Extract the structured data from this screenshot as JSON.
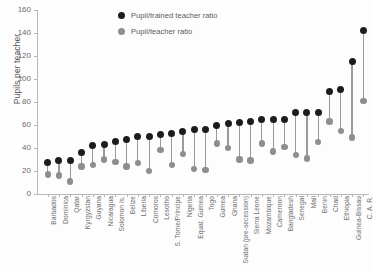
{
  "chart_data": {
    "type": "scatter",
    "title": "",
    "xlabel": "",
    "ylabel": "Pupils per teacher",
    "ylim": [
      0,
      160
    ],
    "yticks": [
      0,
      20,
      40,
      60,
      80,
      100,
      120,
      140,
      160
    ],
    "grid": false,
    "legend_position": "top-center",
    "categories": [
      "Barbados",
      "Dominica",
      "Qatar",
      "Kyrgyzstan",
      "Guyana",
      "Nicaragua",
      "Solomon Is.",
      "Belize",
      "Liberia",
      "Comoros",
      "Lesotho",
      "S. Tome/Principe",
      "Nigeria",
      "Equat. Guinea",
      "Togo",
      "Guinea",
      "Ghana",
      "Sudan (pre-secession)",
      "Sierra Leone",
      "Mozambique",
      "Cameroon",
      "Bangladesh",
      "Senegal",
      "Mali",
      "Benin",
      "Chad",
      "Ethiopia",
      "Guinea-Bissau",
      "C. A. R."
    ],
    "series": [
      {
        "name": "Pupil/trained teacher ratio",
        "color": "#1c1c1c",
        "values": [
          27,
          29,
          29,
          36,
          42,
          43,
          46,
          47,
          50,
          50,
          52,
          53,
          54,
          56,
          56,
          60,
          61,
          62,
          63,
          65,
          65,
          65,
          71,
          71,
          71,
          89,
          91,
          115,
          142
        ]
      },
      {
        "name": "Pupil/teacher ratio",
        "color": "#8e8e8e",
        "values": [
          17,
          16,
          11,
          24,
          25,
          30,
          28,
          24,
          27,
          20,
          38,
          25,
          35,
          22,
          21,
          44,
          40,
          30,
          29,
          44,
          37,
          41,
          34,
          31,
          45,
          63,
          55,
          49,
          81
        ]
      }
    ],
    "legend": [
      {
        "label": "Pupil/trained teacher ratio",
        "color": "#1c1c1c"
      },
      {
        "label": "Pupil/teacher ratio",
        "color": "#8e8e8e"
      }
    ]
  }
}
